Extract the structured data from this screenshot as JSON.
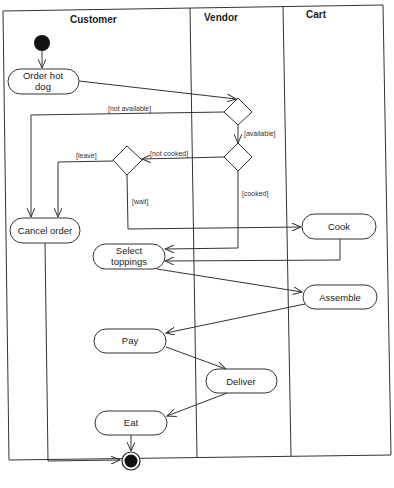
{
  "diagram": {
    "type": "UML activity diagram",
    "swimlanes": [
      {
        "name": "Customer"
      },
      {
        "name": "Vendor"
      },
      {
        "name": "Cart"
      }
    ],
    "activities": [
      {
        "id": "order",
        "label_line1": "Order hot",
        "label_line2": "dog",
        "lane": "Customer"
      },
      {
        "id": "cancel",
        "label": "Cancel order",
        "lane": "Customer"
      },
      {
        "id": "select",
        "label_line1": "Select",
        "label_line2": "toppings",
        "lane": "Customer"
      },
      {
        "id": "cook",
        "label": "Cook",
        "lane": "Cart"
      },
      {
        "id": "assemble",
        "label": "Assemble",
        "lane": "Cart"
      },
      {
        "id": "pay",
        "label": "Pay",
        "lane": "Customer"
      },
      {
        "id": "deliver",
        "label": "Deliver",
        "lane": "Vendor"
      },
      {
        "id": "eat",
        "label": "Eat",
        "lane": "Customer"
      }
    ],
    "guards": {
      "not_available": "[not available]",
      "available": "[available]",
      "not_cooked": "[not cooked]",
      "cooked": "[cooked]",
      "leave": "[leave]",
      "wait": "[wait]"
    },
    "nodes": {
      "initial": "initial-node",
      "final": "final-node",
      "decisions": [
        "availability-decision",
        "cooked-decision",
        "wait-decision"
      ]
    },
    "colors": {
      "stroke": "#333333",
      "fill": "#ffffff",
      "node_fill": "#111111"
    }
  }
}
